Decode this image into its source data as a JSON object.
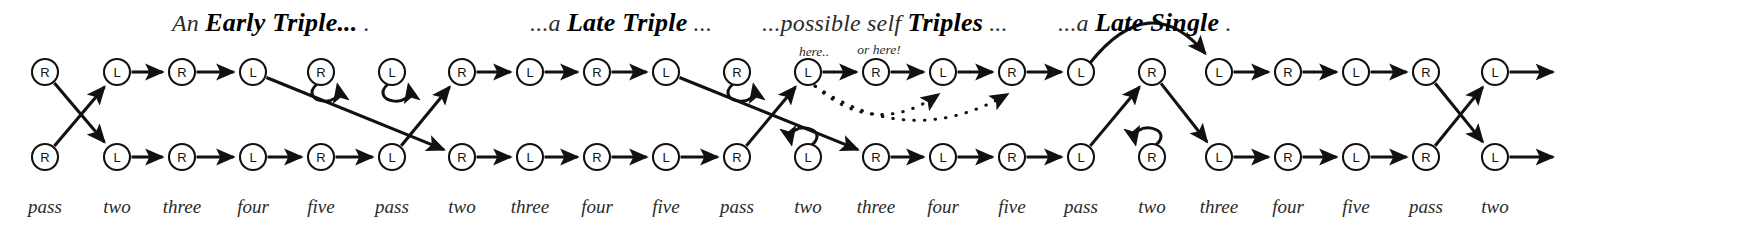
{
  "figure": {
    "width": 1755,
    "height": 234,
    "background": "#ffffff",
    "ink_color": "#111111",
    "label_color": "#2a2a2a",
    "type": "state-transition-diagram"
  },
  "headings": [
    {
      "id": "early-triple",
      "lead": "An ",
      "strong": "Early Triple...",
      "trail": " .",
      "x": 172,
      "y": 8
    },
    {
      "id": "late-triple",
      "lead": "...a ",
      "strong": "Late Triple",
      "trail": " ...",
      "x": 530,
      "y": 8
    },
    {
      "id": "possible-self-triples",
      "lead": "...possible self ",
      "strong": "Triples",
      "trail": " ...",
      "x": 762,
      "y": 8
    },
    {
      "id": "late-single",
      "lead": "...a ",
      "strong": "Late Single",
      "trail": " .",
      "x": 1058,
      "y": 8
    }
  ],
  "callouts": [
    {
      "id": "here",
      "text": "here..",
      "x": 814,
      "y": 56
    },
    {
      "id": "or-here",
      "text": "or here!",
      "x": 879,
      "y": 54
    }
  ],
  "columns": [
    {
      "index": 0,
      "label": "pass",
      "x": 45
    },
    {
      "index": 1,
      "label": "two",
      "x": 117
    },
    {
      "index": 2,
      "label": "three",
      "x": 182
    },
    {
      "index": 3,
      "label": "four",
      "x": 253
    },
    {
      "index": 4,
      "label": "five",
      "x": 321
    },
    {
      "index": 5,
      "label": "pass",
      "x": 392
    },
    {
      "index": 6,
      "label": "two",
      "x": 462
    },
    {
      "index": 7,
      "label": "three",
      "x": 530
    },
    {
      "index": 8,
      "label": "four",
      "x": 597
    },
    {
      "index": 9,
      "label": "five",
      "x": 666
    },
    {
      "index": 10,
      "label": "pass",
      "x": 737
    },
    {
      "index": 11,
      "label": "two",
      "x": 808
    },
    {
      "index": 12,
      "label": "three",
      "x": 876
    },
    {
      "index": 13,
      "label": "four",
      "x": 943
    },
    {
      "index": 14,
      "label": "five",
      "x": 1012
    },
    {
      "index": 15,
      "label": "pass",
      "x": 1081
    },
    {
      "index": 16,
      "label": "two",
      "x": 1152
    },
    {
      "index": 17,
      "label": "three",
      "x": 1219
    },
    {
      "index": 18,
      "label": "four",
      "x": 1288
    },
    {
      "index": 19,
      "label": "five",
      "x": 1356
    },
    {
      "index": 20,
      "label": "pass",
      "x": 1426
    },
    {
      "index": 21,
      "label": "two",
      "x": 1495
    }
  ],
  "rows": {
    "top_y": 72,
    "bottom_y": 157,
    "label_y": 213,
    "node_radius": 13
  },
  "nodes_top": [
    {
      "col": 0,
      "letter": "R"
    },
    {
      "col": 1,
      "letter": "L"
    },
    {
      "col": 2,
      "letter": "R"
    },
    {
      "col": 3,
      "letter": "L"
    },
    {
      "col": 4,
      "letter": "R"
    },
    {
      "col": 5,
      "letter": "L"
    },
    {
      "col": 6,
      "letter": "R"
    },
    {
      "col": 7,
      "letter": "L"
    },
    {
      "col": 8,
      "letter": "R"
    },
    {
      "col": 9,
      "letter": "L"
    },
    {
      "col": 10,
      "letter": "R"
    },
    {
      "col": 11,
      "letter": "L"
    },
    {
      "col": 12,
      "letter": "R"
    },
    {
      "col": 13,
      "letter": "L"
    },
    {
      "col": 14,
      "letter": "R"
    },
    {
      "col": 15,
      "letter": "L"
    },
    {
      "col": 16,
      "letter": "R"
    },
    {
      "col": 17,
      "letter": "L"
    },
    {
      "col": 18,
      "letter": "R"
    },
    {
      "col": 19,
      "letter": "L"
    },
    {
      "col": 20,
      "letter": "R"
    },
    {
      "col": 21,
      "letter": "L"
    }
  ],
  "nodes_bottom": [
    {
      "col": 0,
      "letter": "R"
    },
    {
      "col": 1,
      "letter": "L"
    },
    {
      "col": 2,
      "letter": "R"
    },
    {
      "col": 3,
      "letter": "L"
    },
    {
      "col": 4,
      "letter": "R"
    },
    {
      "col": 5,
      "letter": "L"
    },
    {
      "col": 6,
      "letter": "R"
    },
    {
      "col": 7,
      "letter": "L"
    },
    {
      "col": 8,
      "letter": "R"
    },
    {
      "col": 9,
      "letter": "L"
    },
    {
      "col": 10,
      "letter": "R"
    },
    {
      "col": 11,
      "letter": "L"
    },
    {
      "col": 12,
      "letter": "R"
    },
    {
      "col": 13,
      "letter": "L"
    },
    {
      "col": 14,
      "letter": "R"
    },
    {
      "col": 15,
      "letter": "L"
    },
    {
      "col": 16,
      "letter": "R"
    },
    {
      "col": 17,
      "letter": "L"
    },
    {
      "col": 18,
      "letter": "R"
    },
    {
      "col": 19,
      "letter": "L"
    },
    {
      "col": 20,
      "letter": "R"
    },
    {
      "col": 21,
      "letter": "L"
    }
  ],
  "edges": [
    {
      "kind": "straight",
      "from_row": "top",
      "from_col": 0,
      "to_row": "bottom",
      "to_col": 1
    },
    {
      "kind": "straight",
      "from_row": "bottom",
      "from_col": 0,
      "to_row": "top",
      "to_col": 1
    },
    {
      "kind": "straight",
      "from_row": "top",
      "from_col": 1,
      "to_row": "top",
      "to_col": 2
    },
    {
      "kind": "straight",
      "from_row": "top",
      "from_col": 2,
      "to_row": "top",
      "to_col": 3
    },
    {
      "kind": "straight",
      "from_row": "bottom",
      "from_col": 1,
      "to_row": "bottom",
      "to_col": 2
    },
    {
      "kind": "straight",
      "from_row": "bottom",
      "from_col": 2,
      "to_row": "bottom",
      "to_col": 3
    },
    {
      "kind": "straight",
      "from_row": "bottom",
      "from_col": 3,
      "to_row": "bottom",
      "to_col": 4
    },
    {
      "kind": "straight",
      "from_row": "bottom",
      "from_col": 4,
      "to_row": "bottom",
      "to_col": 5
    },
    {
      "kind": "straight",
      "from_row": "top",
      "from_col": 3,
      "to_row": "bottom",
      "to_col": 6
    },
    {
      "kind": "straight",
      "from_row": "bottom",
      "from_col": 5,
      "to_row": "top",
      "to_col": 6
    },
    {
      "kind": "selfloop",
      "row": "top",
      "col": 4
    },
    {
      "kind": "selfloop",
      "row": "top",
      "col": 5
    },
    {
      "kind": "straight",
      "from_row": "top",
      "from_col": 6,
      "to_row": "top",
      "to_col": 7
    },
    {
      "kind": "straight",
      "from_row": "top",
      "from_col": 7,
      "to_row": "top",
      "to_col": 8
    },
    {
      "kind": "straight",
      "from_row": "top",
      "from_col": 8,
      "to_row": "top",
      "to_col": 9
    },
    {
      "kind": "straight",
      "from_row": "bottom",
      "from_col": 6,
      "to_row": "bottom",
      "to_col": 7
    },
    {
      "kind": "straight",
      "from_row": "bottom",
      "from_col": 7,
      "to_row": "bottom",
      "to_col": 8
    },
    {
      "kind": "straight",
      "from_row": "bottom",
      "from_col": 8,
      "to_row": "bottom",
      "to_col": 9
    },
    {
      "kind": "straight",
      "from_row": "bottom",
      "from_col": 9,
      "to_row": "bottom",
      "to_col": 10
    },
    {
      "kind": "selfloop",
      "row": "top",
      "col": 10
    },
    {
      "kind": "selfloop",
      "row": "bottom",
      "col": 11,
      "mirror": true
    },
    {
      "kind": "straight",
      "from_row": "top",
      "from_col": 9,
      "to_row": "bottom",
      "to_col": 12
    },
    {
      "kind": "straight",
      "from_row": "bottom",
      "from_col": 10,
      "to_row": "top",
      "to_col": 11
    },
    {
      "kind": "straight",
      "from_row": "top",
      "from_col": 11,
      "to_row": "top",
      "to_col": 12
    },
    {
      "kind": "straight",
      "from_row": "top",
      "from_col": 12,
      "to_row": "top",
      "to_col": 13
    },
    {
      "kind": "straight",
      "from_row": "top",
      "from_col": 13,
      "to_row": "top",
      "to_col": 14
    },
    {
      "kind": "straight",
      "from_row": "top",
      "from_col": 14,
      "to_row": "top",
      "to_col": 15
    },
    {
      "kind": "straight",
      "from_row": "bottom",
      "from_col": 12,
      "to_row": "bottom",
      "to_col": 13
    },
    {
      "kind": "straight",
      "from_row": "bottom",
      "from_col": 13,
      "to_row": "bottom",
      "to_col": 14
    },
    {
      "kind": "straight",
      "from_row": "bottom",
      "from_col": 14,
      "to_row": "bottom",
      "to_col": 15
    },
    {
      "kind": "dotted",
      "from_row": "top",
      "from_col": 11,
      "to_row": "top",
      "to_col": 13,
      "sag": 42
    },
    {
      "kind": "dotted",
      "from_row": "top",
      "from_col": 11,
      "to_row": "top",
      "to_col": 14,
      "sag": 50
    },
    {
      "kind": "arc",
      "from_row": "top",
      "from_col": 15,
      "to_row": "top",
      "to_col": 17,
      "rise": 42
    },
    {
      "kind": "straight",
      "from_row": "bottom",
      "from_col": 15,
      "to_row": "top",
      "to_col": 16
    },
    {
      "kind": "straight",
      "from_row": "top",
      "from_col": 16,
      "to_row": "bottom",
      "to_col": 17
    },
    {
      "kind": "selfloop",
      "row": "bottom",
      "col": 16,
      "mirror": true
    },
    {
      "kind": "straight",
      "from_row": "top",
      "from_col": 17,
      "to_row": "top",
      "to_col": 18
    },
    {
      "kind": "straight",
      "from_row": "top",
      "from_col": 18,
      "to_row": "top",
      "to_col": 19
    },
    {
      "kind": "straight",
      "from_row": "top",
      "from_col": 19,
      "to_row": "top",
      "to_col": 20
    },
    {
      "kind": "straight",
      "from_row": "bottom",
      "from_col": 17,
      "to_row": "bottom",
      "to_col": 18
    },
    {
      "kind": "straight",
      "from_row": "bottom",
      "from_col": 18,
      "to_row": "bottom",
      "to_col": 19
    },
    {
      "kind": "straight",
      "from_row": "bottom",
      "from_col": 19,
      "to_row": "bottom",
      "to_col": 20
    },
    {
      "kind": "straight",
      "from_row": "top",
      "from_col": 20,
      "to_row": "bottom",
      "to_col": 21
    },
    {
      "kind": "straight",
      "from_row": "bottom",
      "from_col": 20,
      "to_row": "top",
      "to_col": 21
    },
    {
      "kind": "stub",
      "from_row": "top",
      "from_col": 21,
      "length": 58
    },
    {
      "kind": "stub",
      "from_row": "bottom",
      "from_col": 21,
      "length": 58
    }
  ]
}
